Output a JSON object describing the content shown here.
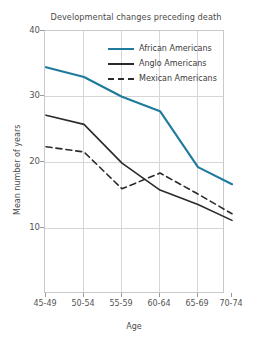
{
  "chart_data": {
    "type": "line",
    "title": "Developmental changes preceding death",
    "xlabel": "Age",
    "ylabel": "Mean number of years",
    "categories": [
      "45-49",
      "50-54",
      "55-59",
      "60-64",
      "65-69",
      "70-74"
    ],
    "ylim": [
      0,
      40
    ],
    "yticks": [
      10,
      20,
      30,
      40
    ],
    "grid": true,
    "legend_position": "upper right",
    "series": [
      {
        "name": "African Americans",
        "values": [
          34.5,
          33.0,
          30.0,
          27.8,
          19.3,
          16.7
        ],
        "color": "#1f7a9c",
        "style": "solid"
      },
      {
        "name": "Anglo Americans",
        "values": [
          27.2,
          25.8,
          19.9,
          15.8,
          13.6,
          11.2
        ],
        "color": "#2b2b2b",
        "style": "solid"
      },
      {
        "name": "Mexican Americans",
        "values": [
          22.4,
          21.6,
          16.0,
          18.4,
          15.2,
          12.2
        ],
        "color": "#2b2b2b",
        "style": "dashed"
      }
    ]
  },
  "axes": {
    "ytick_labels": [
      "40",
      "30",
      "20",
      "10"
    ],
    "xtick_labels": [
      "45-49",
      "50-54",
      "55-59",
      "60-64",
      "65-69",
      "70-74"
    ]
  },
  "legend": {
    "items": [
      {
        "label": "African Americans"
      },
      {
        "label": "Anglo Americans"
      },
      {
        "label": "Mexican Americans"
      }
    ]
  }
}
